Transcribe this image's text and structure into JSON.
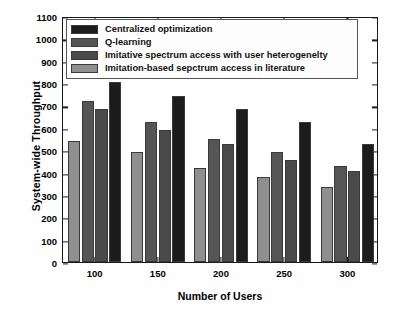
{
  "chart_data": {
    "type": "bar",
    "title": "",
    "xlabel": "Number of Users",
    "ylabel": "System-wide Throughput",
    "categories": [
      "100",
      "150",
      "200",
      "250",
      "300"
    ],
    "ylim": [
      0,
      1100
    ],
    "ytick_values": [
      0,
      100,
      200,
      300,
      400,
      500,
      600,
      700,
      800,
      900,
      1000,
      1100
    ],
    "ytick_labels": [
      "0",
      "100",
      "200",
      "300",
      "400",
      "500",
      "600",
      "700",
      "800",
      "900",
      "1000",
      "1100"
    ],
    "grid": false,
    "legend_position": "upper-left-inside",
    "bar_draw_order": [
      "Imitation-based sepctrum access in literature",
      "Q-learning",
      "Imitative spectrum access with user heterogenelty",
      "Centralized optimization"
    ],
    "series": [
      {
        "name": "Centralized optimization",
        "color": "#1c1c1c",
        "values": [
          803,
          744,
          686,
          624,
          527
        ]
      },
      {
        "name": "Q-learning",
        "color": "#555555",
        "values": [
          720,
          628,
          550,
          493,
          430
        ]
      },
      {
        "name": "Imitative spectrum access with user heterogenelty",
        "color": "#4a4a4a",
        "values": [
          683,
          590,
          527,
          458,
          405
        ]
      },
      {
        "name": "Imitation-based sepctrum access in literature",
        "color": "#8f8f8f",
        "values": [
          543,
          492,
          422,
          378,
          337
        ]
      }
    ]
  },
  "legend": {
    "items": [
      {
        "label": "Centralized optimization",
        "color": "#1c1c1c"
      },
      {
        "label": "Q-learning",
        "color": "#555555"
      },
      {
        "label": "Imitative spectrum access with user heterogenelty",
        "color": "#4a4a4a"
      },
      {
        "label": "Imitation-based sepctrum access in literature",
        "color": "#8f8f8f"
      }
    ]
  },
  "axes": {
    "x_title": "Number of Users",
    "y_title": "System-wide Throughput"
  }
}
